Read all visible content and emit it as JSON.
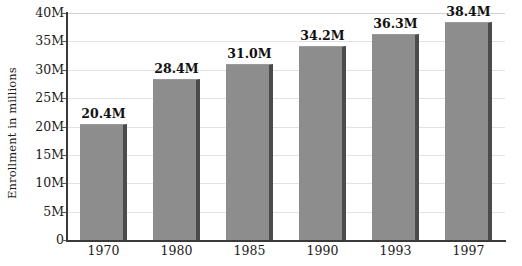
{
  "chart_data": {
    "type": "bar",
    "title": "",
    "subtitle": "",
    "xlabel": "",
    "ylabel": "Enrollment in millions",
    "categories": [
      "1970",
      "1980",
      "1985",
      "1990",
      "1993",
      "1997"
    ],
    "values": [
      20.4,
      28.4,
      31.0,
      34.2,
      36.3,
      38.4
    ],
    "value_labels": [
      "20.4M",
      "28.4M",
      "31.0M",
      "34.2M",
      "36.3M",
      "38.4M"
    ],
    "ylim": [
      0,
      40
    ],
    "ytick_values": [
      0,
      5,
      10,
      15,
      20,
      25,
      30,
      35,
      40
    ],
    "ytick_labels": [
      "0",
      "5M",
      "10M",
      "15M",
      "20M",
      "25M",
      "30M",
      "35M",
      "40M"
    ],
    "grid": true,
    "grid_axis": "y",
    "legend": false,
    "legend_position": "none",
    "series": [
      {
        "name": "Enrollment",
        "values": [
          20.4,
          28.4,
          31.0,
          34.2,
          36.3,
          38.4
        ]
      }
    ],
    "colors": {
      "bar_fill": "#8d8d8d",
      "bar_shadow": "#4b4b4b",
      "gridline": "#e2e2e2",
      "axis": "#3a3a3a",
      "text": "#1a1a1a",
      "background": "#ffffff"
    }
  }
}
